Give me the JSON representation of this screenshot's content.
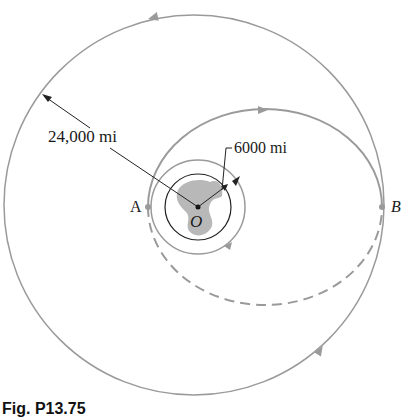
{
  "figure": {
    "caption": "Fig. P13.75",
    "labels": {
      "outer_radius": "24,000 mi",
      "inner_radius": "6000 mi",
      "point_a": "A",
      "point_b": "B",
      "center": "O"
    },
    "colors": {
      "orbit": "#9a9a9a",
      "leader": "#222222",
      "earth_fill": "#b8b8b8"
    }
  }
}
